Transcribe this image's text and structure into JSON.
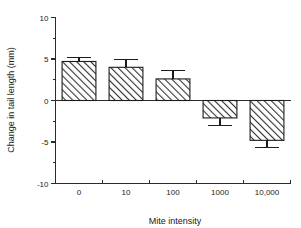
{
  "chart_data": {
    "type": "bar",
    "title": "",
    "xlabel": "Mite intensity",
    "ylabel": "Change in tail length (mm)",
    "categories": [
      "0",
      "10",
      "100",
      "1000",
      "10,000"
    ],
    "values": [
      4.7,
      4.0,
      2.6,
      -2.1,
      -4.8
    ],
    "errors": [
      0.5,
      0.9,
      1.0,
      0.9,
      0.9
    ],
    "ylim": [
      -10,
      10
    ],
    "ytick_labels": [
      "10",
      "5",
      "0",
      "-5",
      "-10"
    ],
    "ytick_values": [
      10,
      5,
      0,
      -5,
      -10
    ],
    "yminor_values": [
      7.5,
      2.5,
      -2.5,
      -7.5
    ],
    "grid": false,
    "legend": null,
    "bar_fill": "diagonal-hatch",
    "bar_edge_color": "#1c1c1c",
    "axis_color": "#2b2b2b"
  },
  "figure": {
    "background": "#ffffff"
  }
}
